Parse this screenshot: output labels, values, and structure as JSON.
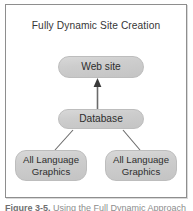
{
  "figure": {
    "title": "Fully Dynamic Site Creation",
    "caption_label": "Figure 3-5.",
    "caption_text": "Using the Full Dynamic Approach",
    "frame_border_color": "#8e8e8e",
    "background_color": "#ffffff"
  },
  "diagram": {
    "type": "flow",
    "node_fill_color": "#cdcdcd",
    "node_border_color": "#bdbdbd",
    "connector_color": "#6b6b6b",
    "nodes": [
      {
        "id": "website",
        "label": "Web site",
        "shape": "rounded-rectangle",
        "level": 0
      },
      {
        "id": "database",
        "label": "Database",
        "shape": "rounded-rectangle",
        "level": 1
      },
      {
        "id": "graphics-left",
        "label": "All Language\nGraphics",
        "shape": "rounded-rectangle",
        "level": 2
      },
      {
        "id": "graphics-right",
        "label": "All Language\nGraphics",
        "shape": "rounded-rectangle",
        "level": 2
      }
    ],
    "connectors": [
      {
        "id": "database-to-website",
        "from": "database",
        "to": "website",
        "style": "vertical-line",
        "arrowhead": "up"
      },
      {
        "id": "graphics-left-to-database",
        "from": "graphics-left",
        "to": "database",
        "style": "diagonal-line",
        "arrowhead": "none"
      },
      {
        "id": "graphics-right-to-database",
        "from": "graphics-right",
        "to": "database",
        "style": "diagonal-line",
        "arrowhead": "none"
      }
    ]
  }
}
